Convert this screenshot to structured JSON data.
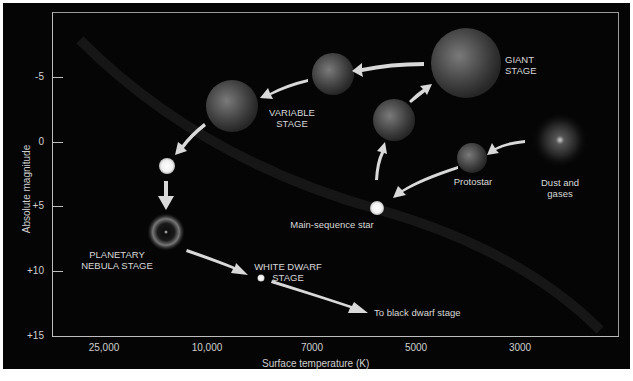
{
  "diagram": {
    "type": "stellar-evolution-hr-diagram",
    "y_axis": {
      "title": "Absolute magnitude",
      "ticks": [
        "-5",
        "0",
        "+5",
        "+10",
        "+15"
      ]
    },
    "x_axis": {
      "title": "Surface temperature (K)",
      "ticks": [
        "25,000",
        "10,000",
        "7000",
        "5000",
        "3000"
      ]
    },
    "stages": [
      {
        "id": "dust",
        "label_line1": "Dust and",
        "label_line2": "gases"
      },
      {
        "id": "protostar",
        "label_line1": "Protostar",
        "label_line2": ""
      },
      {
        "id": "main-sequence",
        "label_line1": "Main-sequence star",
        "label_line2": ""
      },
      {
        "id": "giant",
        "label_line1": "GIANT",
        "label_line2": "STAGE"
      },
      {
        "id": "variable",
        "label_line1": "VARIABLE",
        "label_line2": "STAGE"
      },
      {
        "id": "planetary-nebula",
        "label_line1": "PLANETARY",
        "label_line2": "NEBULA STAGE"
      },
      {
        "id": "white-dwarf",
        "label_line1": "WHITE DWARF",
        "label_line2": "STAGE"
      },
      {
        "id": "black-dwarf",
        "label_line1": "To black dwarf stage",
        "label_line2": ""
      }
    ],
    "colors": {
      "background": "#050505",
      "axis": "#bdbdbd",
      "text": "#d8d8d8",
      "arrow": "#d9d9d9"
    }
  }
}
